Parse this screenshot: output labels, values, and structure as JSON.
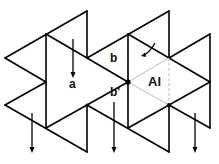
{
  "diagram": {
    "labels": {
      "a": "a",
      "b": "b",
      "b_prime": "b'",
      "al": "Al"
    },
    "colors": {
      "edge": "#000000",
      "guide": "#bdbdbd",
      "background": "#ffffff"
    }
  }
}
